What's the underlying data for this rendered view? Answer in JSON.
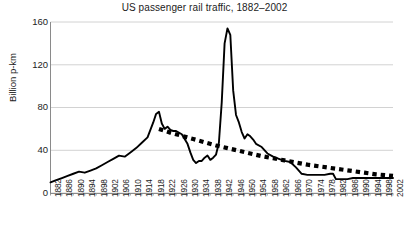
{
  "chart_data": {
    "type": "line",
    "title": "US passenger rail traffic, 1882–2002",
    "xlabel": "",
    "ylabel": "Billion p-km",
    "ylim": [
      0,
      160
    ],
    "xlim": [
      1882,
      2002
    ],
    "yticks": [
      160,
      120,
      80,
      40,
      0
    ],
    "ytick_labels": [
      "160",
      "120",
      "80",
      "40",
      "0"
    ],
    "grid": true,
    "legend": "none",
    "xticks": [
      1882,
      1886,
      1890,
      1894,
      1898,
      1902,
      1906,
      1910,
      1914,
      1918,
      1922,
      1926,
      1930,
      1934,
      1938,
      1942,
      1946,
      1950,
      1954,
      1958,
      1962,
      1966,
      1970,
      1974,
      1978,
      1982,
      1986,
      1990,
      1994,
      1998,
      2002
    ],
    "xtick_labels": [
      "1882",
      "1886",
      "1890",
      "1894",
      "1898",
      "1902",
      "1906",
      "1910",
      "1914",
      "1918",
      "1922",
      "1926",
      "1930",
      "1934",
      "1938",
      "1942",
      "1946",
      "1950",
      "1954",
      "1958",
      "1962",
      "1966",
      "1970",
      "1974",
      "1978",
      "1982",
      "1986",
      "1990",
      "1994",
      "1998",
      "2002"
    ],
    "series": [
      {
        "name": "US passenger rail traffic",
        "style": "solid",
        "color": "#000000",
        "x": [
          1882,
          1884,
          1886,
          1888,
          1890,
          1892,
          1894,
          1896,
          1898,
          1900,
          1902,
          1904,
          1906,
          1908,
          1910,
          1912,
          1914,
          1916,
          1918,
          1919,
          1920,
          1921,
          1922,
          1923,
          1924,
          1925,
          1926,
          1928,
          1930,
          1931,
          1932,
          1933,
          1934,
          1935,
          1936,
          1937,
          1938,
          1939,
          1940,
          1941,
          1942,
          1943,
          1944,
          1945,
          1946,
          1947,
          1948,
          1949,
          1950,
          1951,
          1952,
          1953,
          1954,
          1956,
          1958,
          1960,
          1962,
          1964,
          1966,
          1968,
          1970,
          1972,
          1974,
          1976,
          1978,
          1980,
          1981,
          1982,
          1984,
          1986,
          1988,
          1990,
          1992,
          1994,
          1996,
          1998,
          2000,
          2002
        ],
        "y": [
          10,
          12,
          14,
          16,
          18,
          20,
          19,
          21,
          23,
          26,
          29,
          32,
          35,
          34,
          38,
          42,
          47,
          52,
          66,
          74,
          76,
          65,
          60,
          62,
          59,
          58,
          58,
          55,
          46,
          38,
          31,
          28,
          30,
          30,
          33,
          35,
          31,
          33,
          36,
          47,
          85,
          140,
          154,
          148,
          96,
          73,
          66,
          57,
          51,
          55,
          53,
          50,
          46,
          43,
          37,
          34,
          32,
          30,
          29,
          24,
          18,
          17,
          17,
          17,
          17,
          18,
          18,
          13,
          13,
          13,
          14,
          14,
          14,
          14,
          14,
          14,
          14,
          14
        ]
      },
      {
        "name": "Trend (log-linear decline)",
        "style": "dotted",
        "color": "#000000",
        "x": [
          1920,
          1924,
          1928,
          1932,
          1936,
          1940,
          1944,
          1948,
          1952,
          1956,
          1960,
          1964,
          1968,
          1972,
          1976,
          1980,
          1984,
          1988,
          1992,
          1996,
          2000,
          2002
        ],
        "y": [
          60,
          56.5,
          53.5,
          50.5,
          47.5,
          44.5,
          42,
          39.5,
          37,
          34.5,
          32.5,
          30.5,
          28.5,
          26.5,
          25,
          23.5,
          22,
          20.5,
          19,
          17.5,
          16.5,
          16
        ]
      }
    ]
  }
}
